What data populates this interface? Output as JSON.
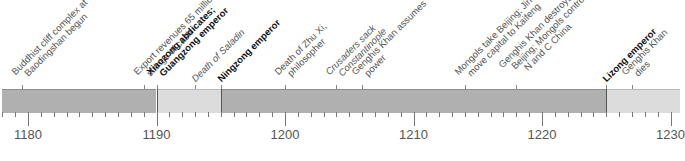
{
  "timeline": {
    "start_year": 1178,
    "end_year": 1230,
    "px_per_year": 12.85,
    "origin_x": 28,
    "year_labels": [
      {
        "year": 1180,
        "label": "1180"
      },
      {
        "year": 1190,
        "label": "1190"
      },
      {
        "year": 1200,
        "label": "1200"
      },
      {
        "year": 1210,
        "label": "1210"
      },
      {
        "year": 1220,
        "label": "1220"
      },
      {
        "year": 1230,
        "label": "1230"
      }
    ],
    "segments": [
      {
        "from": 1178,
        "to": 1190,
        "shade": "dark",
        "color": "#b0b0b0"
      },
      {
        "from": 1190,
        "to": 1195,
        "shade": "light",
        "color": "#dcdcdc"
      },
      {
        "from": 1195,
        "to": 1225,
        "shade": "dark",
        "color": "#b0b0b0"
      },
      {
        "from": 1225,
        "to": 1231,
        "shade": "light",
        "color": "#dcdcdc"
      }
    ],
    "events": [
      {
        "year": 1179.5,
        "lines": [
          "Buddhist cliff complex at",
          "Baodingshan begun"
        ],
        "style": "normal"
      },
      {
        "year": 1189,
        "lines": [
          "Export revenues 65 million",
          "strings of cash"
        ],
        "style": "normal"
      },
      {
        "year": 1190,
        "lines": [
          "Xiaozong abdicates;",
          "Guangzong emperor"
        ],
        "style": "bold"
      },
      {
        "year": 1193,
        "lines": [
          "Death of Saladin"
        ],
        "style": "italic"
      },
      {
        "year": 1195,
        "lines": [
          "Ningzong emperor"
        ],
        "style": "bold"
      },
      {
        "year": 1200,
        "lines": [
          "Death of Zhu Xi,",
          "philosopher"
        ],
        "style": "normal"
      },
      {
        "year": 1204,
        "lines": [
          "Crusaders sack",
          "Constantinople"
        ],
        "style": "italic"
      },
      {
        "year": 1206,
        "lines": [
          "Genghis Khan assumes",
          "power"
        ],
        "style": "normal"
      },
      {
        "year": 1214,
        "lines": [
          "Mongols take Beijing; Jin",
          "move capital to Kaifeng"
        ],
        "style": "normal"
      },
      {
        "year": 1218,
        "lines": [
          "Genghis Khan destroys",
          "Beijing; Mongols control",
          "N and C China"
        ],
        "style": "normal"
      },
      {
        "year": 1225,
        "lines": [
          "Lizong emperor"
        ],
        "style": "bold"
      },
      {
        "year": 1227,
        "lines": [
          "Genghis Khan",
          "dies"
        ],
        "style": "normal"
      }
    ]
  }
}
